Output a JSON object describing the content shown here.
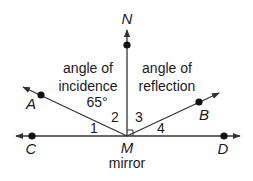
{
  "diagram": {
    "points": {
      "N": "N",
      "A": "A",
      "B": "B",
      "C": "C",
      "D": "D",
      "M": "M"
    },
    "labels": {
      "incidence_line1": "angle of",
      "incidence_line2": "incidence",
      "incidence_value": "65°",
      "reflection_line1": "angle of",
      "reflection_line2": "reflection",
      "mirror": "mirror"
    },
    "angles": {
      "a1": "1",
      "a2": "2",
      "a3": "3",
      "a4": "4"
    },
    "colors": {
      "stroke": "#333333",
      "text": "#1a1a1a"
    }
  }
}
